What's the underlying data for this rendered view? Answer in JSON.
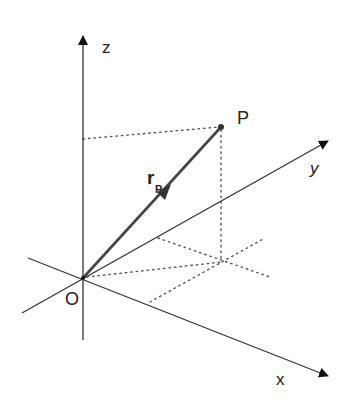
{
  "diagram": {
    "type": "3d-coordinate-system",
    "labels": {
      "z_axis": "z",
      "y_axis": "y",
      "x_axis": "x",
      "origin": "O",
      "point": "P",
      "vector": "r",
      "vector_subscript": "P"
    },
    "colors": {
      "axis": "#333333",
      "vector": "#444444",
      "dotted": "#555555",
      "background": "#ffffff"
    }
  }
}
